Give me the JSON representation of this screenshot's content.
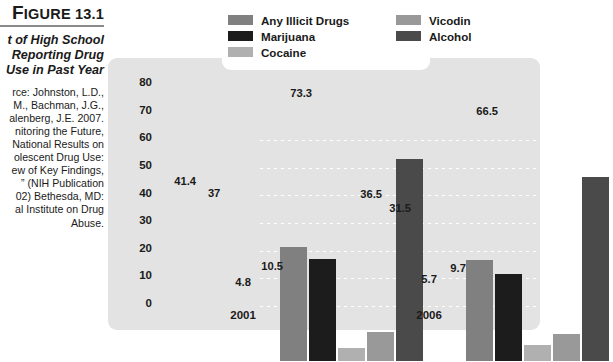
{
  "figure": {
    "number_label": "FIGURE 13.1",
    "number_dropcap": "F",
    "number_rest": "IGURE 13.1",
    "subtitle_lines": [
      "t of High School",
      "Reporting Drug",
      "Use in Past Year"
    ],
    "source_lead": "rce:",
    "source_lines": [
      "rce: Johnston, L.D.,",
      "M., Bachman, J.G.,",
      "alenberg, J.E. 2007.",
      "nitoring the Future,",
      "National Results on",
      "olescent Drug Use:",
      "ew of Key Findings,",
      "” (NIH Publication",
      "02) Bethesda, MD:",
      "al Institute on Drug",
      "Abuse."
    ]
  },
  "legend": {
    "columns": [
      {
        "items": [
          {
            "label": "Any Illicit Drugs",
            "color": "#808080"
          },
          {
            "label": "Marijuana",
            "color": "#1c1c1c"
          },
          {
            "label": "Cocaine",
            "color": "#b0b0b0"
          }
        ]
      },
      {
        "items": [
          {
            "label": "Vicodin",
            "color": "#999999"
          },
          {
            "label": "Alcohol",
            "color": "#4a4a4a"
          }
        ]
      }
    ]
  },
  "chart_data": {
    "type": "bar",
    "xlabel": "",
    "ylabel": "",
    "categories": [
      "2001",
      "2006"
    ],
    "ylim": [
      0,
      80
    ],
    "yticks": [
      0,
      10,
      20,
      30,
      40,
      50,
      60,
      70,
      80
    ],
    "ytick_labels": [
      "0",
      "10",
      "20",
      "30",
      "40",
      "50",
      "60",
      "70",
      "80"
    ],
    "grid": true,
    "grid_style": "dotted-white-horizontal",
    "legend_position": "top",
    "series": [
      {
        "name": "Any Illicit Drugs",
        "color": "#808080",
        "values": [
          41.4,
          36.5
        ],
        "value_labels": [
          "41.4",
          "36.5"
        ]
      },
      {
        "name": "Marijuana",
        "color": "#1c1c1c",
        "values": [
          37,
          31.5
        ],
        "value_labels": [
          "37",
          "31.5"
        ]
      },
      {
        "name": "Cocaine",
        "color": "#b0b0b0",
        "values": [
          4.8,
          5.7
        ],
        "value_labels": [
          "4.8",
          "5.7"
        ]
      },
      {
        "name": "Vicodin",
        "color": "#999999",
        "values": [
          10.5,
          9.7
        ],
        "value_labels": [
          "10.5",
          "9.7"
        ]
      },
      {
        "name": "Alcohol",
        "color": "#4a4a4a",
        "values": [
          73.3,
          66.5
        ],
        "value_labels": [
          "73.3",
          "66.5"
        ]
      }
    ]
  }
}
